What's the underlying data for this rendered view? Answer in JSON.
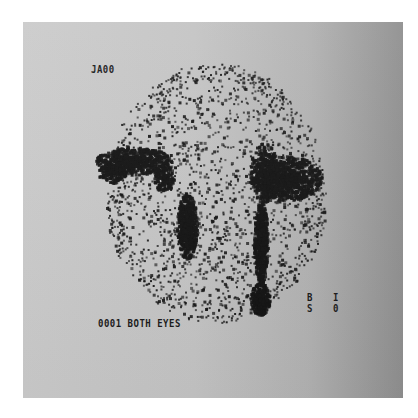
{
  "scan": {
    "top_left_label": "JA00",
    "bottom_left_label": "0001 BOTH EYES",
    "right_labels": {
      "row1_left": "B",
      "row1_right": "I",
      "row2_left": "S",
      "row2_right": "0"
    }
  },
  "colors": {
    "page_background": "#ffffff",
    "panel_light": "#cbcbcb",
    "panel_dark": "#8f8f8f",
    "ink": "#141414"
  }
}
